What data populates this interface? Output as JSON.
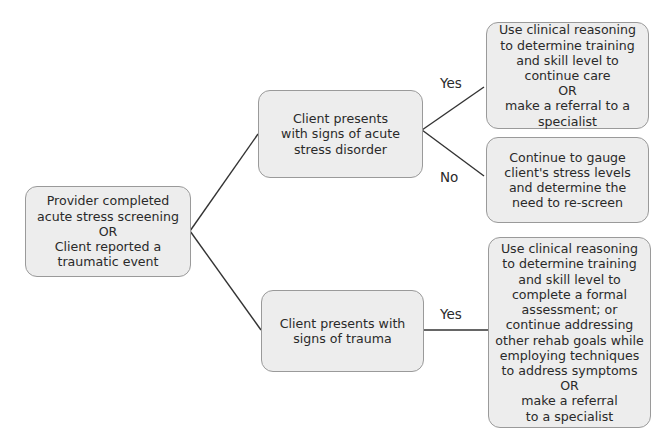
{
  "diagram": {
    "type": "decision-tree",
    "nodes": {
      "root": {
        "lines": [
          "Provider completed",
          "acute stress screening",
          "OR",
          "Client reported a",
          "traumatic event"
        ]
      },
      "acute": {
        "lines": [
          "Client presents",
          "with signs of acute",
          "stress disorder"
        ]
      },
      "acute_yes": {
        "lines": [
          "Use clinical reasoning",
          "to determine training",
          "and skill level to",
          "continue care",
          "OR",
          "make a referral to a",
          "specialist"
        ]
      },
      "acute_no": {
        "lines": [
          "Continue to gauge",
          "client's stress levels",
          "and determine the",
          "need to re-screen"
        ]
      },
      "trauma": {
        "lines": [
          "Client presents with",
          "signs of trauma"
        ]
      },
      "trauma_yes": {
        "lines": [
          "Use clinical reasoning",
          "to determine training",
          "and skill level to",
          "complete a formal",
          "assessment; or",
          "continue addressing",
          "other rehab goals while",
          "employing techniques",
          "to address symptoms",
          "OR",
          "make a referral",
          "to a specialist"
        ]
      }
    },
    "edge_labels": {
      "acute_yes": "Yes",
      "acute_no": "No",
      "trauma_yes": "Yes"
    },
    "colors": {
      "box_fill": "#ededed",
      "box_border": "#9a9a9a",
      "line": "#333333"
    }
  }
}
